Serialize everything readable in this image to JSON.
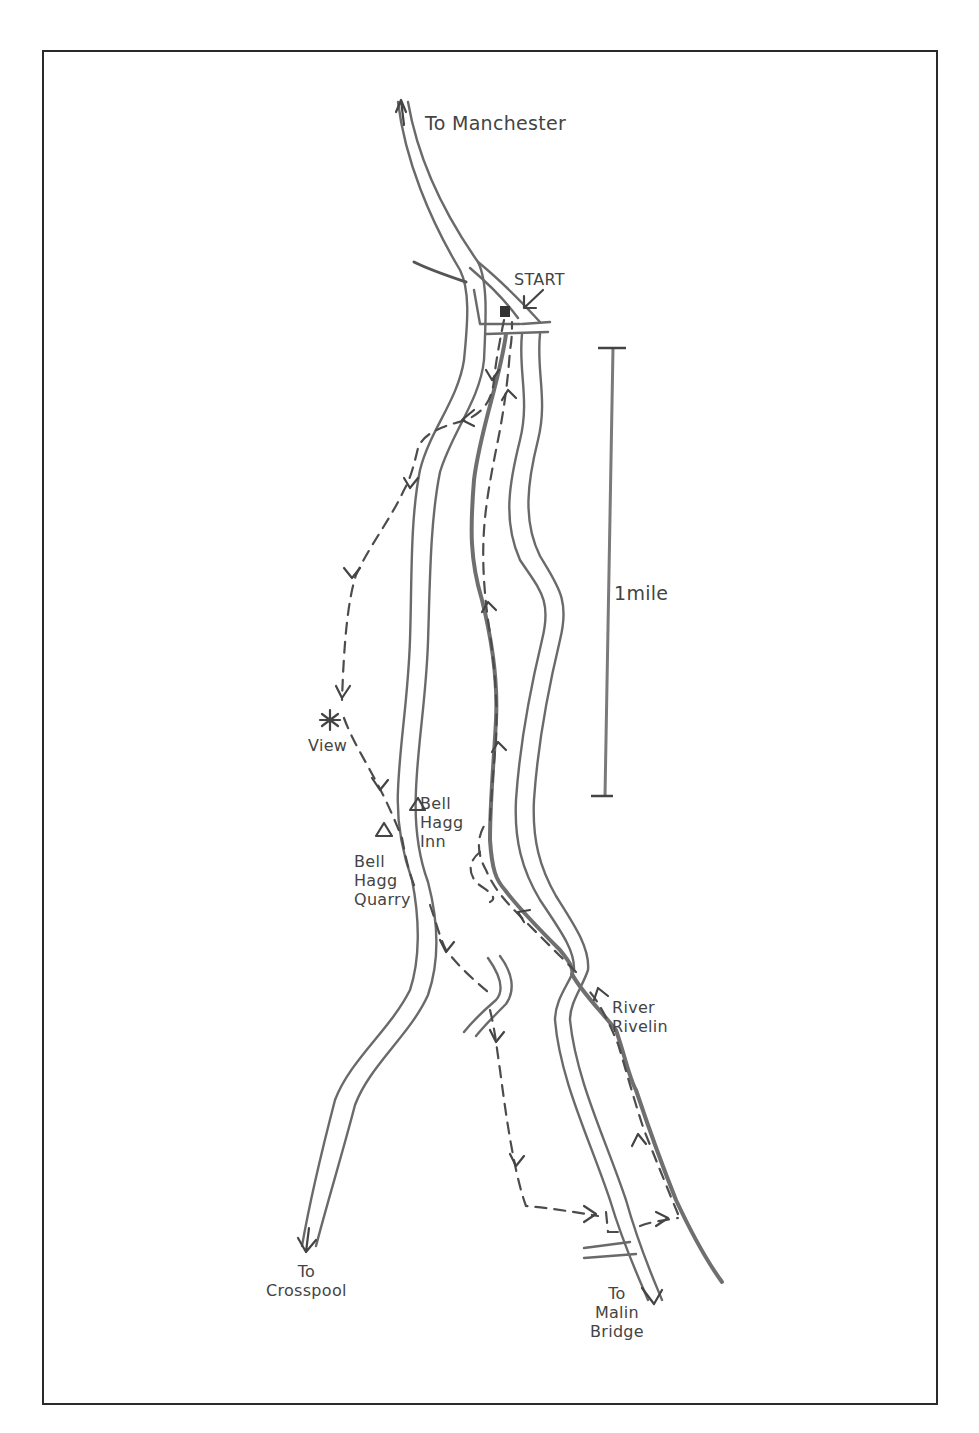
{
  "map": {
    "type": "hand-drawn walking route map",
    "labels": {
      "to_manchester": "To Manchester",
      "start": "START",
      "scale": "1mile",
      "view": "View",
      "bell_hagg_inn": "Bell\nHagg\nInn",
      "bell_hagg_quarry": "Bell\nHagg\nQuarry",
      "river_rivelin": "River\nRivelin",
      "to_crosspool": "To\nCrosspool",
      "to_malin_bridge": "To\nMalin\nBridge"
    },
    "features": {
      "start_marker": "car-park-square",
      "view_marker": "viewpoint-star",
      "inn_marker": "triangle",
      "quarry_marker": "triangle",
      "route_style": "dashed-with-arrows",
      "scale_bar": {
        "length_label": "1mile"
      }
    },
    "colors": {
      "ink": "#4c4c4c",
      "road": "#6a6a6a",
      "frame": "#2a2a2a",
      "background": "#ffffff"
    }
  }
}
